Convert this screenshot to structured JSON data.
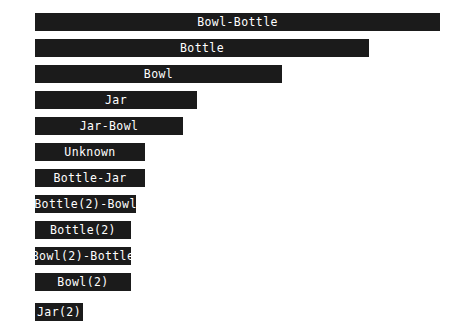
{
  "chart_data": {
    "type": "bar",
    "orientation": "horizontal",
    "title": "",
    "xlabel": "",
    "ylabel": "",
    "grid": false,
    "legend": "none",
    "xlim": [
      0,
      62
    ],
    "categories": [
      "Bowl-Bottle",
      "Bottle",
      "Bowl",
      "Jar",
      "Jar-Bowl",
      "Unknown",
      "Bottle-Jar",
      "Bottle(2)-Bowl",
      "Bottle(2)",
      "Bowl(2)-Bottle",
      "Bowl(2)",
      "Jar(2)"
    ],
    "values": [
      62,
      53,
      20,
      8,
      6,
      4,
      4,
      3,
      2,
      2,
      2,
      1
    ],
    "bars": [
      {
        "value_label": "62",
        "label": "Bowl-Bottle",
        "value": 62,
        "y": 13,
        "width": 405
      },
      {
        "value_label": "53",
        "label": "Bottle",
        "value": 53,
        "y": 39,
        "width": 334
      },
      {
        "value_label": "20",
        "label": "Bowl",
        "value": 20,
        "y": 65,
        "width": 247
      },
      {
        "value_label": "8",
        "label": "Jar",
        "value": 8,
        "y": 91,
        "width": 162
      },
      {
        "value_label": "6",
        "label": "Jar-Bowl",
        "value": 6,
        "y": 117,
        "width": 148
      },
      {
        "value_label": "4",
        "label": "Unknown",
        "value": 4,
        "y": 143,
        "width": 110
      },
      {
        "value_label": "4",
        "label": "Bottle-Jar",
        "value": 4,
        "y": 169,
        "width": 110
      },
      {
        "value_label": "3",
        "label": "Bottle(2)-Bowl",
        "value": 3,
        "y": 195,
        "width": 101
      },
      {
        "value_label": "2",
        "label": "Bottle(2)",
        "value": 2,
        "y": 221,
        "width": 96
      },
      {
        "value_label": "2",
        "label": "Bowl(2)-Bottle",
        "value": 2,
        "y": 247,
        "width": 96
      },
      {
        "value_label": "2",
        "label": "Bowl(2)",
        "value": 2,
        "y": 273,
        "width": 96
      },
      {
        "value_label": "1",
        "label": "Jar(2)",
        "value": 1,
        "y": 303,
        "width": 48
      }
    ],
    "colors": {
      "bar": "#1b1b1b",
      "bar_label_text": "#ffffff",
      "value_label_text": "#000000",
      "background": "#ffffff"
    }
  }
}
